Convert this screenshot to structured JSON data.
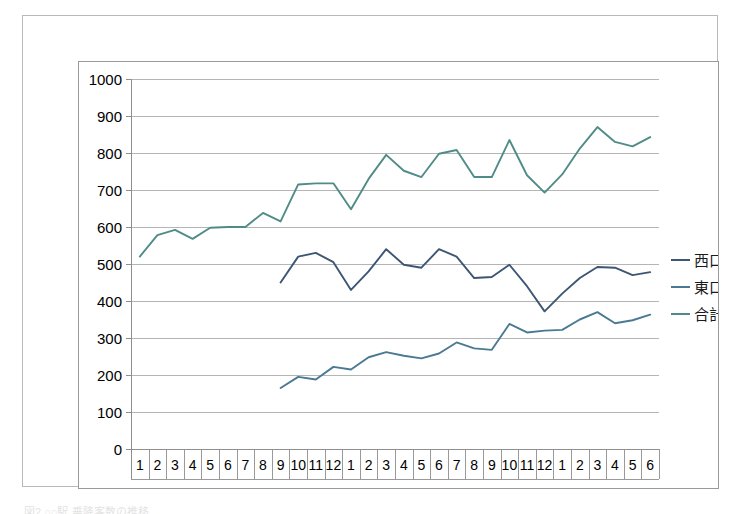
{
  "document": {
    "caption_partial": "図2  ○○駅 乗降客数の推移"
  },
  "legend": {
    "position": "right",
    "items": [
      {
        "label": "西口",
        "color": "#3d5673"
      },
      {
        "label": "東口",
        "color": "#4a7a93"
      },
      {
        "label": "合計",
        "color": "#4f8c87"
      }
    ]
  },
  "chart_data": {
    "type": "line",
    "title": "",
    "subtitle": "",
    "xlabel": "",
    "ylabel": "",
    "grid": true,
    "legend_position": "right",
    "ylim": [
      0,
      1000
    ],
    "yticks": [
      0,
      100,
      200,
      300,
      400,
      500,
      600,
      700,
      800,
      900,
      1000
    ],
    "ytick_labels": [
      "0",
      "100",
      "200",
      "300",
      "400",
      "500",
      "600",
      "700",
      "800",
      "900",
      "1000"
    ],
    "categories": [
      "1",
      "2",
      "3",
      "4",
      "5",
      "6",
      "7",
      "8",
      "9",
      "10",
      "11",
      "12",
      "1",
      "2",
      "3",
      "4",
      "5",
      "6",
      "7",
      "8",
      "9",
      "10",
      "11",
      "12",
      "1",
      "2",
      "3",
      "4",
      "5",
      "6"
    ],
    "series": [
      {
        "name": "西口",
        "color": "#3d5673",
        "values": [
          null,
          null,
          null,
          null,
          null,
          null,
          null,
          null,
          450,
          520,
          530,
          505,
          430,
          480,
          540,
          498,
          490,
          540,
          520,
          462,
          465,
          498,
          440,
          372,
          420,
          462,
          492,
          490,
          470,
          478
        ]
      },
      {
        "name": "東口",
        "color": "#4a7a93",
        "values": [
          null,
          null,
          null,
          null,
          null,
          null,
          null,
          null,
          165,
          195,
          188,
          222,
          215,
          248,
          262,
          252,
          245,
          258,
          288,
          272,
          268,
          338,
          315,
          320,
          322,
          350,
          370,
          340,
          348,
          363
        ]
      },
      {
        "name": "合計",
        "color": "#4f8c87",
        "values": [
          520,
          578,
          592,
          568,
          598,
          600,
          600,
          638,
          615,
          715,
          718,
          718,
          648,
          730,
          795,
          752,
          735,
          798,
          808,
          735,
          735,
          835,
          740,
          693,
          742,
          812,
          870,
          830,
          818,
          843
        ]
      }
    ]
  }
}
